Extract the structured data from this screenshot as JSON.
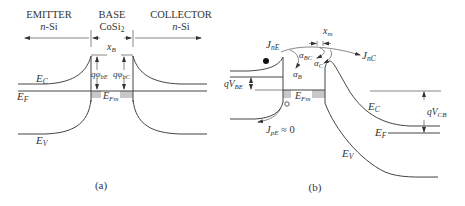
{
  "panel_a": {
    "caption": "(a)",
    "regions": {
      "emitter": {
        "title": "EMITTER",
        "material_italic": "n",
        "material_rest": "-Si"
      },
      "base": {
        "title": "BASE",
        "material": "CoSi",
        "material_sub": "2"
      },
      "collector": {
        "title": "COLLECTOR",
        "material_italic": "n",
        "material_rest": "-Si"
      }
    },
    "width_label": {
      "main": "x",
      "sub": "B"
    },
    "bands": {
      "ec": {
        "main": "E",
        "sub": "C"
      },
      "ef": {
        "main": "E",
        "sub": "F"
      },
      "ev": {
        "main": "E",
        "sub": "V"
      },
      "efm": {
        "main": "E",
        "sub": "Fm"
      }
    },
    "barriers": {
      "emitter_side": {
        "main": "qφ",
        "sub": "bE"
      },
      "collector_side": {
        "main": "qφ",
        "sub": "bC"
      }
    }
  },
  "panel_b": {
    "caption": "(b)",
    "currents": {
      "jne": {
        "main": "J",
        "sub": "nE"
      },
      "jnc": {
        "main": "J",
        "sub": "nC"
      },
      "jpe": {
        "main": "J",
        "sub": "pE",
        "suffix": " ≈ 0"
      }
    },
    "coefficients": {
      "alpha_b": {
        "main": "α",
        "sub": "B"
      },
      "alpha_bc": {
        "main": "α",
        "sub": "BC"
      },
      "alpha_c": {
        "main": "α",
        "sub": "C"
      }
    },
    "xm_label": {
      "main": "x",
      "sub": "m"
    },
    "voltages": {
      "vbe": {
        "main": "qV",
        "sub": "BE"
      },
      "vcb": {
        "main": "qV",
        "sub": "CB"
      }
    },
    "bands": {
      "ec": {
        "main": "E",
        "sub": "C"
      },
      "ef": {
        "main": "E",
        "sub": "F"
      },
      "ev": {
        "main": "E",
        "sub": "V"
      },
      "efm": {
        "main": "E",
        "sub": "Fm"
      }
    },
    "carriers": {
      "electron": "filled-circle",
      "hole": "open-circle"
    }
  }
}
